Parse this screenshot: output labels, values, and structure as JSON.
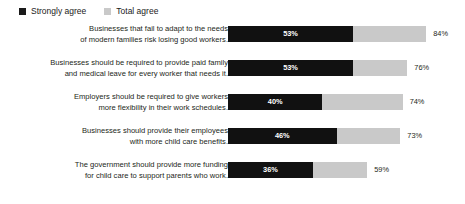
{
  "legend": {
    "items": [
      {
        "label": "Strongly agree",
        "swatch": "strong",
        "color": "#111111"
      },
      {
        "label": "Total agree",
        "swatch": "total",
        "color": "#c9c9c9"
      }
    ]
  },
  "chart_data": {
    "type": "bar",
    "orientation": "horizontal",
    "stacked": true,
    "title": "",
    "subtitle": "",
    "xlabel": "",
    "ylabel": "",
    "xlim": [
      0,
      100
    ],
    "grid": false,
    "legend_position": "top-left",
    "value_suffix": "%",
    "categories": [
      "Businesses that fail to adapt to the needs\nof modern families risk losing good workers.",
      "Businesses should be required to provide paid family\nand medical leave for every worker that needs it.",
      "Employers should be required to give workers\nmore flexibility in their work schedules.",
      "Businesses should provide their employees\nwith more child care benefits.",
      "The government should provide more funding\nfor child care to support parents who work."
    ],
    "series": [
      {
        "name": "Strongly agree",
        "values": [
          53,
          53,
          40,
          46,
          36
        ]
      },
      {
        "name": "Total agree",
        "values": [
          84,
          76,
          74,
          73,
          59
        ]
      }
    ],
    "rows": [
      {
        "label": "Businesses that fail to adapt to the needs\nof modern families risk losing good workers.",
        "strongly_agree": 53,
        "total_agree": 84,
        "strongly_agree_label": "53%",
        "total_agree_label": "84%"
      },
      {
        "label": "Businesses should be required to provide paid family\nand medical leave for every worker that needs it.",
        "strongly_agree": 53,
        "total_agree": 76,
        "strongly_agree_label": "53%",
        "total_agree_label": "76%"
      },
      {
        "label": "Employers should be required to give workers\nmore flexibility in their work schedules.",
        "strongly_agree": 40,
        "total_agree": 74,
        "strongly_agree_label": "40%",
        "total_agree_label": "74%"
      },
      {
        "label": "Businesses should provide their employees\nwith more child care benefits.",
        "strongly_agree": 46,
        "total_agree": 73,
        "strongly_agree_label": "46%",
        "total_agree_label": "73%"
      },
      {
        "label": "The government should provide more funding\nfor child care to support parents who work.",
        "strongly_agree": 36,
        "total_agree": 59,
        "strongly_agree_label": "36%",
        "total_agree_label": "59%"
      }
    ]
  }
}
